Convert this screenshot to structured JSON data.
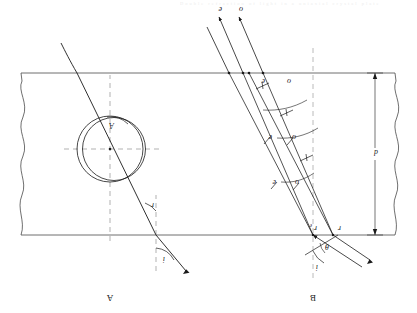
{
  "figure": {
    "caption_faint": "Double refraction of light in a uniaxial crystal plate",
    "panels": [
      {
        "id": "B",
        "label": "B",
        "x": 106,
        "y": 14
      },
      {
        "id": "A",
        "label": "A",
        "x": 306,
        "y": 14
      }
    ],
    "slab": {
      "thickness_label": "d",
      "top_y": 78,
      "bottom_y": 240,
      "left_x": 22,
      "right_x": 396,
      "edge_style": "wavy-break"
    },
    "panelB": {
      "incident_rays": [
        {
          "name": "ray-1",
          "label": ""
        },
        {
          "name": "ray-2",
          "label": ""
        }
      ],
      "angles": [
        {
          "name": "angle-i",
          "label": "i"
        },
        {
          "name": "angle-theta",
          "label": "θ"
        },
        {
          "name": "angle-r-o",
          "label": "r",
          "sub": "o"
        },
        {
          "name": "angle-r-e",
          "label": "r",
          "sub": "e"
        }
      ],
      "wavefront_labels": [
        {
          "name": "wavefront-o-1",
          "label": "o"
        },
        {
          "name": "wavefront-e-1",
          "label": "e"
        },
        {
          "name": "wavefront-o-2",
          "label": "o"
        },
        {
          "name": "wavefront-e-2",
          "label": "e"
        },
        {
          "name": "wavefront-o-3",
          "label": "o"
        },
        {
          "name": "wavefront-e-3",
          "label": "e"
        }
      ],
      "exit_rays": [
        {
          "name": "exit-ray-o",
          "label": "o"
        },
        {
          "name": "exit-ray-e",
          "label": "e"
        }
      ]
    },
    "panelA": {
      "angles": [
        {
          "name": "angle-i",
          "label": "i"
        },
        {
          "name": "angle-r",
          "label": "r"
        },
        {
          "name": "angle-A",
          "label": "A"
        }
      ],
      "construction": {
        "name": "index-ellipsoid",
        "description": "two overlapping circles (ordinary + extraordinary wave surfaces)"
      }
    },
    "colors": {
      "ink": "#1a1a1a",
      "rule": "#4a4a4a",
      "dashed": "#9a9a9a",
      "faint": "#b9b9b9",
      "paper": "#ffffff"
    }
  }
}
